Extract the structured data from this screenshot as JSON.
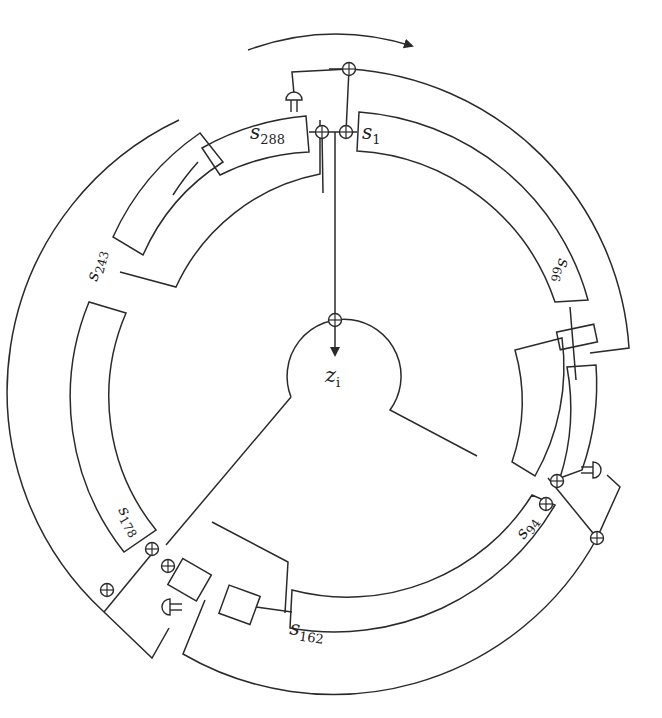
{
  "diagram": {
    "title": "",
    "direction": "clockwise",
    "center": {
      "x": 331,
      "y": 368
    },
    "output": {
      "base": "z",
      "sub": "i"
    },
    "registers": [
      {
        "base": "s",
        "sub": "1"
      },
      {
        "base": "s",
        "sub": "66"
      },
      {
        "base": "s",
        "sub": "94"
      },
      {
        "base": "s",
        "sub": "162"
      },
      {
        "base": "s",
        "sub": "178"
      },
      {
        "base": "s",
        "sub": "243"
      },
      {
        "base": "s",
        "sub": "288"
      }
    ],
    "components": {
      "xor_gates": 11,
      "and_gates": 3,
      "boxes": 3
    },
    "colors": {
      "stroke": "#2a2a2a",
      "background": "#ffffff"
    }
  }
}
